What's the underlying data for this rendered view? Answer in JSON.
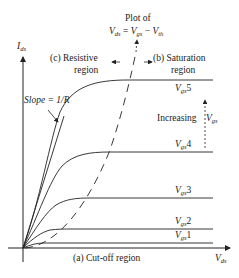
{
  "diagram": {
    "axes": {
      "y_label_main": "I",
      "y_label_sub": "ds",
      "x_label_main": "V",
      "x_label_sub": "ds"
    },
    "plot_of": {
      "line1": "Plot of",
      "lhs_main": "V",
      "lhs_sub": "ds",
      "eq": " = ",
      "v1_main": "V",
      "v1_sub": "gs",
      "minus": " − ",
      "v2_main": "V",
      "v2_sub": "th"
    },
    "regions": {
      "resistive_line1": "(c)  Resistive",
      "resistive_line2": "region",
      "saturation_line1": "(b)  Saturation",
      "saturation_line2": "region",
      "cutoff": "(a)  Cut-off region"
    },
    "slope_label": "Slope = 1/R",
    "increasing_label": "Increasing",
    "increasing_var_main": "V",
    "increasing_var_sub": "gs",
    "curves": [
      {
        "main": "V",
        "sub": "gs",
        "idx": "5"
      },
      {
        "main": "V",
        "sub": "gs",
        "idx": "4"
      },
      {
        "main": "V",
        "sub": "gs",
        "idx": "3"
      },
      {
        "main": "V",
        "sub": "gs",
        "idx": "2"
      },
      {
        "main": "V",
        "sub": "gs",
        "idx": "1"
      }
    ]
  }
}
